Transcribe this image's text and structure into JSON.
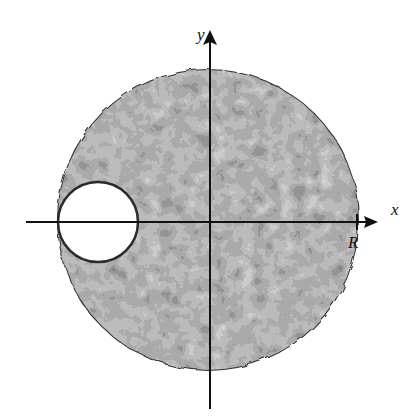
{
  "figure": {
    "axes": {
      "x_label": "x",
      "y_label": "y",
      "tick_label": "R"
    },
    "colors": {
      "background": "#ffffff",
      "axis": "#111111",
      "hole": "#ffffff",
      "texture": [
        "#3a3a3a",
        "#555555",
        "#6e6e6e",
        "#8a8a8a",
        "#a8a8a8",
        "#c4c4c4",
        "#2a2a2a",
        "#d6d6d6"
      ]
    },
    "geometry": {
      "disk": {
        "cx": 208,
        "cy": 220,
        "r": 150
      },
      "hole": {
        "cx": 98,
        "cy": 222,
        "r": 40
      },
      "origin": {
        "x": 210,
        "y": 222
      },
      "x_axis": {
        "x1": 26,
        "x2": 376
      },
      "y_axis": {
        "y1": 28,
        "y2": 409
      },
      "tick_R_x": 357
    }
  }
}
